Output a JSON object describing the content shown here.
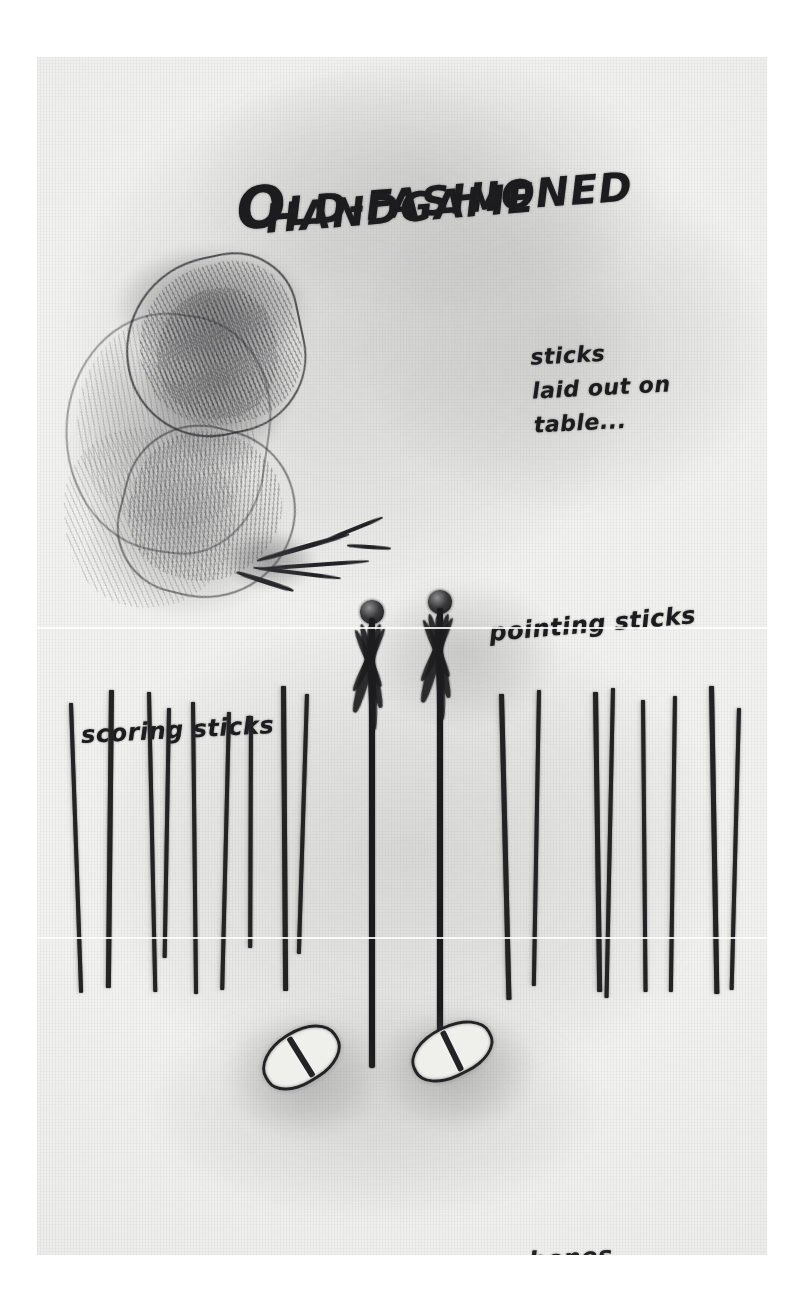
{
  "artwork": {
    "medium": "pencil-sketch",
    "paper_color": "#f2f2f0",
    "ink_color": "#1f1f21"
  },
  "title": {
    "line1_cap": "O",
    "line1_rest": "LD-FASHIONED",
    "line1_full": "OLD-FASHIONED",
    "line2": "HANDGAME"
  },
  "annotations": {
    "table_note": "sticks\nlaid out on\ntable...",
    "pointing_sticks": "pointing sticks",
    "scoring_sticks": "scoring sticks",
    "bones": "bones"
  },
  "elements": {
    "scoring_sticks_left_count": 9,
    "scoring_sticks_right_count": 8,
    "pointing_sticks_count": 2,
    "bones_count": 2,
    "hand_bundle_count": 1
  },
  "scoring_sticks_left": [
    {
      "x": 32,
      "top": 703,
      "height": 290,
      "width": 4,
      "lean": -2.0
    },
    {
      "x": 72,
      "top": 690,
      "height": 298,
      "width": 5,
      "lean": 0.6
    },
    {
      "x": 110,
      "top": 692,
      "height": 300,
      "width": 4,
      "lean": -1.2
    },
    {
      "x": 130,
      "top": 708,
      "height": 250,
      "width": 4,
      "lean": 1.0
    },
    {
      "x": 154,
      "top": 702,
      "height": 292,
      "width": 4,
      "lean": -0.6
    },
    {
      "x": 190,
      "top": 712,
      "height": 278,
      "width": 4,
      "lean": 1.4
    },
    {
      "x": 212,
      "top": 716,
      "height": 232,
      "width": 4,
      "lean": 0.2
    },
    {
      "x": 244,
      "top": 686,
      "height": 305,
      "width": 5,
      "lean": -0.4
    },
    {
      "x": 268,
      "top": 694,
      "height": 260,
      "width": 4,
      "lean": 1.8
    }
  ],
  "scoring_sticks_right": [
    {
      "x": 462,
      "top": 694,
      "height": 306,
      "width": 5,
      "lean": -1.4
    },
    {
      "x": 500,
      "top": 690,
      "height": 296,
      "width": 4,
      "lean": 1.0
    },
    {
      "x": 556,
      "top": 692,
      "height": 300,
      "width": 5,
      "lean": -0.8
    },
    {
      "x": 574,
      "top": 688,
      "height": 310,
      "width": 4,
      "lean": 1.2
    },
    {
      "x": 604,
      "top": 700,
      "height": 292,
      "width": 4,
      "lean": -0.5
    },
    {
      "x": 636,
      "top": 696,
      "height": 296,
      "width": 4,
      "lean": 0.8
    },
    {
      "x": 672,
      "top": 686,
      "height": 308,
      "width": 5,
      "lean": -1.0
    },
    {
      "x": 700,
      "top": 708,
      "height": 282,
      "width": 4,
      "lean": 1.5
    }
  ],
  "pointing_sticks": [
    {
      "x": 320,
      "top": 600,
      "shaft_height": 450
    },
    {
      "x": 388,
      "top": 590,
      "shaft_height": 470
    }
  ],
  "bones": [
    {
      "x": 222,
      "top": 1030,
      "width": 84,
      "height": 54,
      "rotate": -32
    },
    {
      "x": 372,
      "top": 1025,
      "width": 86,
      "height": 52,
      "rotate": -26
    }
  ]
}
